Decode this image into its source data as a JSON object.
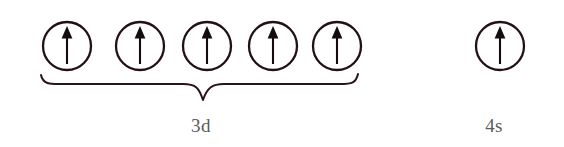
{
  "diagram": {
    "colors": {
      "circle_stroke": "#231014",
      "arrow": "#150c0e",
      "brace": "#2a1317",
      "label_text": "#5b5b5b",
      "background": "#ffffff"
    },
    "groups": [
      {
        "id": "group-3d",
        "label": "3d",
        "label_x": 201,
        "label_y": 132,
        "has_brace": true,
        "brace_left_x": 40,
        "brace_right_x": 358,
        "brace_top_y": 78,
        "brace_tip_x": 201,
        "brace_tip_y": 101,
        "orbitals": [
          {
            "name": "orbital-3d-1",
            "cx": 67,
            "cy": 46,
            "r": 24,
            "electrons": [
              "up"
            ]
          },
          {
            "name": "orbital-3d-2",
            "cx": 140,
            "cy": 46,
            "r": 24,
            "electrons": [
              "up"
            ]
          },
          {
            "name": "orbital-3d-3",
            "cx": 207,
            "cy": 46,
            "r": 24,
            "electrons": [
              "up"
            ]
          },
          {
            "name": "orbital-3d-4",
            "cx": 273,
            "cy": 46,
            "r": 24,
            "electrons": [
              "up"
            ]
          },
          {
            "name": "orbital-3d-5",
            "cx": 337,
            "cy": 46,
            "r": 24,
            "electrons": [
              "up"
            ]
          }
        ]
      },
      {
        "id": "group-4s",
        "label": "4s",
        "label_x": 494,
        "label_y": 132,
        "has_brace": false,
        "orbitals": [
          {
            "name": "orbital-4s-1",
            "cx": 500,
            "cy": 46,
            "r": 24,
            "electrons": [
              "up"
            ]
          }
        ]
      }
    ]
  }
}
